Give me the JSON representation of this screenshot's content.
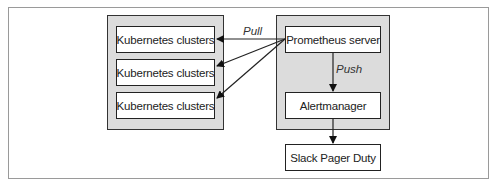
{
  "diagram": {
    "left_group": {
      "nodes": [
        {
          "label": "Kubernetes clusters"
        },
        {
          "label": "Kubernetes clusters"
        },
        {
          "label": "Kubernetes clusters"
        }
      ]
    },
    "right_group": {
      "nodes": [
        {
          "label": "Prometheus server"
        },
        {
          "label": "Alertmanager"
        }
      ]
    },
    "external_node": {
      "label": "Slack Pager Duty"
    },
    "edges": [
      {
        "from": "Prometheus server",
        "to": "Kubernetes clusters 1",
        "label": "Pull"
      },
      {
        "from": "Prometheus server",
        "to": "Kubernetes clusters 2",
        "label": ""
      },
      {
        "from": "Prometheus server",
        "to": "Kubernetes clusters 3",
        "label": ""
      },
      {
        "from": "Prometheus server",
        "to": "Alertmanager",
        "label": "Push"
      },
      {
        "from": "Alertmanager",
        "to": "Slack Pager Duty",
        "label": ""
      }
    ],
    "edge_labels": {
      "pull": "Pull",
      "push": "Push"
    }
  }
}
